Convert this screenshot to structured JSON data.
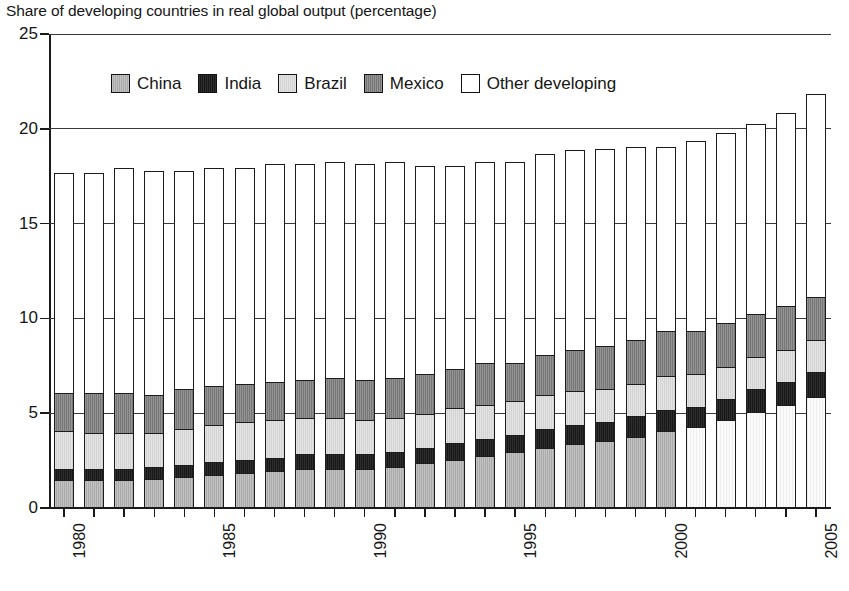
{
  "chart_data": {
    "type": "bar",
    "subtype": "stacked-vertical",
    "title": "Share of developing countries in real global output (percentage)",
    "xlabel": "",
    "ylabel": "",
    "ylim": [
      0,
      25
    ],
    "yticks": [
      0,
      5,
      10,
      15,
      20,
      25
    ],
    "ytick_labels": [
      "0",
      "5",
      "10",
      "15",
      "20",
      "25"
    ],
    "grid": true,
    "grid_axis": "y",
    "legend_position": "top-center",
    "categories": [
      1980,
      1981,
      1982,
      1983,
      1984,
      1985,
      1986,
      1987,
      1988,
      1989,
      1990,
      1991,
      1992,
      1993,
      1994,
      1995,
      1996,
      1997,
      1998,
      1999,
      2000,
      2001,
      2002,
      2003,
      2004,
      2005
    ],
    "xtick_labels": [
      "1980",
      "1985",
      "1990",
      "1995",
      "2000",
      "2005"
    ],
    "xtick_label_years": [
      1980,
      1985,
      1990,
      1995,
      2000,
      2005
    ],
    "series": [
      {
        "name": "China",
        "color": "#a9a9a9",
        "values": [
          1.4,
          1.4,
          1.4,
          1.5,
          1.6,
          1.7,
          1.8,
          1.9,
          2.0,
          2.0,
          2.0,
          2.1,
          2.3,
          2.5,
          2.7,
          2.9,
          3.1,
          3.3,
          3.5,
          3.7,
          4.0,
          4.2,
          4.6,
          5.0,
          5.4,
          5.8
        ]
      },
      {
        "name": "India",
        "color": "#171717",
        "values": [
          0.6,
          0.6,
          0.6,
          0.6,
          0.6,
          0.7,
          0.7,
          0.7,
          0.8,
          0.8,
          0.8,
          0.8,
          0.8,
          0.9,
          0.9,
          0.9,
          1.0,
          1.0,
          1.0,
          1.1,
          1.1,
          1.1,
          1.1,
          1.2,
          1.2,
          1.3
        ]
      },
      {
        "name": "Brazil",
        "color": "#d4d4d4",
        "values": [
          2.0,
          1.9,
          1.9,
          1.8,
          1.9,
          1.9,
          2.0,
          2.0,
          1.9,
          1.9,
          1.8,
          1.8,
          1.8,
          1.8,
          1.8,
          1.8,
          1.8,
          1.8,
          1.7,
          1.7,
          1.8,
          1.7,
          1.7,
          1.7,
          1.7,
          1.7
        ]
      },
      {
        "name": "Mexico",
        "color": "#767676",
        "values": [
          2.0,
          2.1,
          2.1,
          2.0,
          2.1,
          2.1,
          2.0,
          2.0,
          2.0,
          2.1,
          2.1,
          2.1,
          2.1,
          2.1,
          2.2,
          2.0,
          2.1,
          2.2,
          2.3,
          2.3,
          2.4,
          2.3,
          2.3,
          2.3,
          2.3,
          2.3
        ]
      },
      {
        "name": "Other developing",
        "color": "#ffffff",
        "values": [
          11.6,
          11.6,
          11.9,
          11.8,
          11.5,
          11.5,
          11.4,
          11.5,
          11.4,
          11.4,
          11.4,
          11.4,
          11.0,
          10.7,
          10.6,
          10.6,
          10.6,
          10.5,
          10.4,
          10.2,
          9.7,
          10.0,
          10.0,
          10.0,
          10.2,
          10.7
        ]
      }
    ],
    "totals": [
      17.6,
      17.6,
      17.9,
      17.7,
      17.7,
      17.9,
      17.9,
      17.9,
      17.6,
      17.6,
      17.6,
      17.9,
      18.0,
      18.0,
      18.2,
      18.2,
      18.6,
      18.8,
      18.9,
      19.0,
      19.0,
      19.3,
      19.7,
      20.2,
      20.8,
      21.8
    ]
  },
  "legend": {
    "items": [
      {
        "label": "China",
        "swatch": "china"
      },
      {
        "label": "India",
        "swatch": "india"
      },
      {
        "label": "Brazil",
        "swatch": "brazil"
      },
      {
        "label": "Mexico",
        "swatch": "mexico"
      },
      {
        "label": "Other developing",
        "swatch": "other"
      }
    ]
  }
}
